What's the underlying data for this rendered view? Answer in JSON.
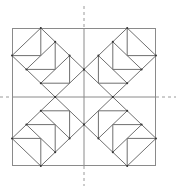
{
  "diagram": {
    "title": "",
    "colors": {
      "background": "#ffffff",
      "outline": "#8a8a8a",
      "lines": "#6f6f6f",
      "axis": "#9a9a9a",
      "vertex": "#333333"
    },
    "quadrants": [
      "top-left",
      "top-right",
      "bottom-left",
      "bottom-right"
    ],
    "geese_per_quadrant": 3,
    "symmetry": "four-fold mirror about vertical and horizontal center axes"
  }
}
